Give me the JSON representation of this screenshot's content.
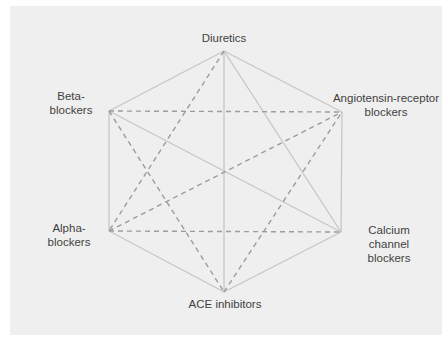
{
  "diagram": {
    "type": "hexagon-interaction-graph",
    "nodes": [
      {
        "id": "diuretics",
        "label": "Diuretics",
        "lines": [
          "Diuretics"
        ],
        "x": 224,
        "y": 51
      },
      {
        "id": "arb",
        "label": "Angiotensin-receptor blockers",
        "lines": [
          "Angiotensin-receptor",
          "blockers"
        ],
        "x": 342,
        "y": 112
      },
      {
        "id": "ccb",
        "label": "Calcium channel blockers",
        "lines": [
          "Calcium",
          "channel",
          "blockers"
        ],
        "x": 341,
        "y": 232
      },
      {
        "id": "ace",
        "label": "ACE inhibitors",
        "lines": [
          "ACE inhibitors"
        ],
        "x": 224,
        "y": 292
      },
      {
        "id": "alpha",
        "label": "Alpha-blockers",
        "lines": [
          "Alpha-",
          "blockers"
        ],
        "x": 109,
        "y": 231
      },
      {
        "id": "beta",
        "label": "Beta-blockers",
        "lines": [
          "Beta-",
          "blockers"
        ],
        "x": 109,
        "y": 111
      }
    ],
    "edges": [
      {
        "from": "diuretics",
        "to": "beta",
        "style": "solid"
      },
      {
        "from": "diuretics",
        "to": "arb",
        "style": "solid"
      },
      {
        "from": "diuretics",
        "to": "ace",
        "style": "solid"
      },
      {
        "from": "diuretics",
        "to": "ccb",
        "style": "solid"
      },
      {
        "from": "beta",
        "to": "alpha",
        "style": "solid"
      },
      {
        "from": "beta",
        "to": "ccb",
        "style": "solid"
      },
      {
        "from": "arb",
        "to": "ccb",
        "style": "solid"
      },
      {
        "from": "alpha",
        "to": "ace",
        "style": "solid"
      },
      {
        "from": "ace",
        "to": "ccb",
        "style": "solid"
      },
      {
        "from": "beta",
        "to": "arb",
        "style": "dashed"
      },
      {
        "from": "alpha",
        "to": "ccb",
        "style": "dashed"
      },
      {
        "from": "diuretics",
        "to": "alpha",
        "style": "dashed"
      },
      {
        "from": "beta",
        "to": "ace",
        "style": "dashed"
      },
      {
        "from": "alpha",
        "to": "arb",
        "style": "dashed"
      },
      {
        "from": "ace",
        "to": "arb",
        "style": "dashed"
      }
    ],
    "colors": {
      "panel": "#efefef",
      "solid_line": "#c6c6c6",
      "dashed_line": "#9c9c9c",
      "text": "#3f3f3f"
    }
  }
}
